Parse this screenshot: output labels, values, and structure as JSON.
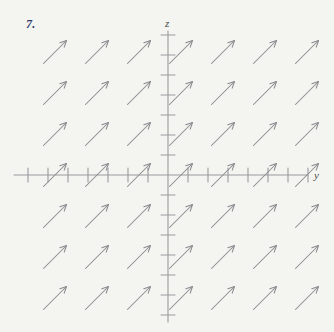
{
  "figure": {
    "problem_number": "7.",
    "problem_number_color": "#2c3c6e",
    "background_color": "#f4f4f0",
    "ink_color": "#8a8a8f",
    "axis_color": "#9a9a9e"
  },
  "chart_data": {
    "type": "scatter",
    "title": "",
    "subtitle": "",
    "xlabel": "y",
    "ylabel": "z",
    "grid": false,
    "legend": null,
    "annotations": [
      "7."
    ],
    "origin": {
      "x": 168,
      "y": 175
    },
    "axes": {
      "horizontal": {
        "label": "y",
        "label_position": {
          "x": 314,
          "y": 179
        },
        "x_start": 14,
        "x_end": 308,
        "y": 175,
        "tick_spacing": 20,
        "tick_half_length": 7,
        "tick_count": 15,
        "tick_positions": [
          28,
          48,
          68,
          88,
          108,
          128,
          148,
          168,
          188,
          208,
          228,
          248,
          268,
          288,
          308
        ]
      },
      "vertical": {
        "label": "z",
        "label_position": {
          "x": 165,
          "y": 27
        },
        "y_start": 31,
        "y_end": 322,
        "x": 168,
        "tick_spacing": 20,
        "tick_half_length": 7,
        "tick_count": 15,
        "tick_positions": [
          35,
          55,
          75,
          95,
          115,
          135,
          155,
          175,
          195,
          215,
          235,
          255,
          275,
          295,
          315
        ]
      }
    },
    "vector_field": {
      "columns": 7,
      "rows": 7,
      "column_x": [
        55,
        97,
        139,
        181,
        223,
        265,
        307
      ],
      "row_y": [
        52,
        93,
        134,
        175,
        216,
        257,
        298
      ],
      "arrow_length": 32,
      "arrow_angle_degrees": 45,
      "arrow_dx": 23,
      "arrow_dy": -23,
      "head_length": 7,
      "uniform_direction": true,
      "direction_note": "all arrows point up and to the right at 45 degrees"
    }
  }
}
